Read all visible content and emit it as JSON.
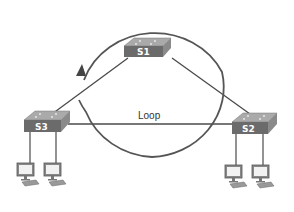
{
  "diagram": {
    "loop_label": "Loop",
    "colors": {
      "line": "#4a4a4a",
      "circle": "#555555",
      "switch_front": "#6b6b6b",
      "switch_top": "#a9a9a9",
      "switch_side": "#8a8a8a",
      "label_text": "#ffffff"
    },
    "switches": [
      {
        "id": "s1",
        "label": "S1"
      },
      {
        "id": "s2",
        "label": "S2"
      },
      {
        "id": "s3",
        "label": "S3"
      }
    ],
    "links": [
      {
        "from": "S1",
        "to": "S2"
      },
      {
        "from": "S1",
        "to": "S3"
      },
      {
        "from": "S2",
        "to": "S3"
      }
    ],
    "hosts": [
      {
        "attached_to": "S3",
        "icon": "pc-icon"
      },
      {
        "attached_to": "S3",
        "icon": "pc-icon"
      },
      {
        "attached_to": "S2",
        "icon": "pc-icon"
      },
      {
        "attached_to": "S2",
        "icon": "pc-icon"
      }
    ],
    "loop_arrow": {
      "direction": "counter-clockwise",
      "icon": "circular-arrow-icon"
    }
  }
}
